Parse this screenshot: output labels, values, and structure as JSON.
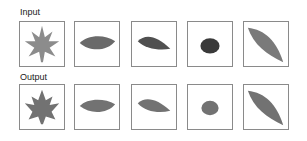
{
  "rows": {
    "input": {
      "label": "Input",
      "items": [
        {
          "shape": "maple-leaf",
          "color": "#8c8c8c"
        },
        {
          "shape": "oval-leaf",
          "color": "#6a6a6a"
        },
        {
          "shape": "tilted-leaf",
          "color": "#505050"
        },
        {
          "shape": "round-blob",
          "color": "#3a3a3a"
        },
        {
          "shape": "long-leaf",
          "color": "#7a7a7a"
        }
      ]
    },
    "output": {
      "label": "Output",
      "items": [
        {
          "shape": "maple-leaf",
          "color": "#727272"
        },
        {
          "shape": "oval-leaf",
          "color": "#727272"
        },
        {
          "shape": "tilted-leaf",
          "color": "#727272"
        },
        {
          "shape": "round-blob",
          "color": "#727272"
        },
        {
          "shape": "long-leaf",
          "color": "#727272"
        }
      ]
    }
  }
}
